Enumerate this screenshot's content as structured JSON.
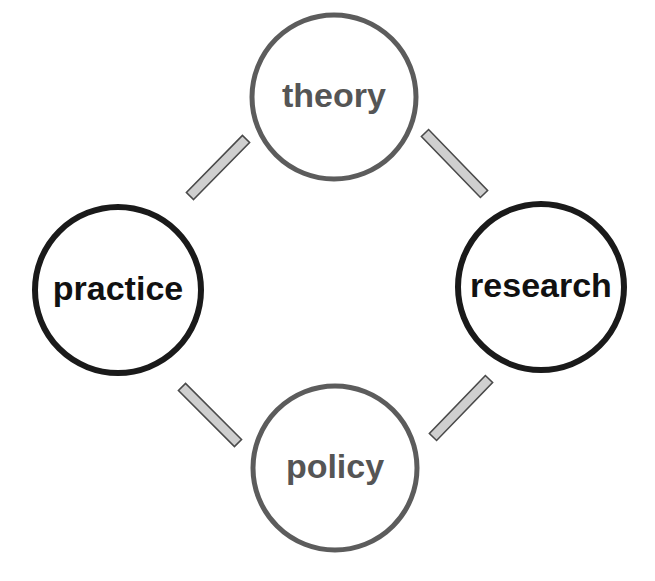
{
  "diagram": {
    "type": "cycle",
    "canvas": {
      "width": 655,
      "height": 581,
      "background": "#ffffff"
    },
    "palette": {
      "dark_stroke": "#1a1a1a",
      "gray_stroke": "#5c5c5c",
      "connector_fill": "#cfcfcf",
      "connector_stroke": "#4a4a4a",
      "node_fill": "#ffffff"
    },
    "nodes": [
      {
        "id": "theory",
        "label": "theory",
        "position": "top",
        "cx": 334,
        "cy": 97,
        "r": 82,
        "stroke": "#5c5c5c",
        "stroke_width": 5,
        "text_color": "#555555",
        "font_size": 34
      },
      {
        "id": "practice",
        "label": "practice",
        "position": "left",
        "cx": 118,
        "cy": 290,
        "r": 83,
        "stroke": "#1a1a1a",
        "stroke_width": 6,
        "text_color": "#111111",
        "font_size": 34
      },
      {
        "id": "research",
        "label": "research",
        "position": "right",
        "cx": 541,
        "cy": 287,
        "r": 83,
        "stroke": "#1a1a1a",
        "stroke_width": 6,
        "text_color": "#111111",
        "font_size": 34
      },
      {
        "id": "policy",
        "label": "policy",
        "position": "bottom",
        "cx": 335,
        "cy": 468,
        "r": 82,
        "stroke": "#5c5c5c",
        "stroke_width": 5,
        "text_color": "#555555",
        "font_size": 34
      }
    ],
    "connectors": [
      {
        "id": "practice-theory",
        "from": "practice",
        "to": "theory",
        "x1": 190,
        "y1": 196,
        "x2": 246,
        "y2": 139,
        "thickness": 10,
        "fill": "#cfcfcf",
        "stroke": "#4a4a4a"
      },
      {
        "id": "theory-research",
        "from": "theory",
        "to": "research",
        "x1": 425,
        "y1": 133,
        "x2": 484,
        "y2": 194,
        "thickness": 10,
        "fill": "#cfcfcf",
        "stroke": "#4a4a4a"
      },
      {
        "id": "research-policy",
        "from": "research",
        "to": "policy",
        "x1": 489,
        "y1": 379,
        "x2": 433,
        "y2": 437,
        "thickness": 10,
        "fill": "#cfcfcf",
        "stroke": "#4a4a4a"
      },
      {
        "id": "policy-practice",
        "from": "policy",
        "to": "practice",
        "x1": 238,
        "y1": 443,
        "x2": 182,
        "y2": 387,
        "thickness": 10,
        "fill": "#cfcfcf",
        "stroke": "#4a4a4a"
      }
    ]
  }
}
